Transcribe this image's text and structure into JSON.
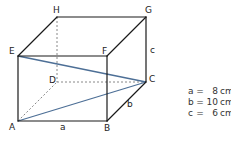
{
  "diagram": {
    "type": "cuboid",
    "vertices": {
      "A": {
        "label": "A",
        "x": 18,
        "y": 121
      },
      "B": {
        "label": "B",
        "x": 107,
        "y": 121
      },
      "C": {
        "label": "C",
        "x": 146,
        "y": 82
      },
      "D": {
        "label": "D",
        "x": 57,
        "y": 82
      },
      "E": {
        "label": "E",
        "x": 18,
        "y": 56
      },
      "F": {
        "label": "F",
        "x": 107,
        "y": 56
      },
      "G": {
        "label": "G",
        "x": 146,
        "y": 17
      },
      "H": {
        "label": "H",
        "x": 57,
        "y": 17
      }
    },
    "edge_labels": {
      "a": "a",
      "b": "b",
      "c": "c"
    },
    "highlighted_segments": [
      "EC",
      "AC"
    ],
    "hidden_edges": [
      "HD",
      "DC",
      "AD"
    ],
    "colors": {
      "edge": "#1a1a1a",
      "hidden_edge": "#888888",
      "highlight": "#4d6f96"
    }
  },
  "legend": {
    "rows": [
      {
        "var": "a",
        "eq": "=",
        "value": "8",
        "unit": "cm"
      },
      {
        "var": "b",
        "eq": "=",
        "value": "10",
        "unit": "cm"
      },
      {
        "var": "c",
        "eq": "=",
        "value": "6",
        "unit": "cm"
      }
    ]
  }
}
